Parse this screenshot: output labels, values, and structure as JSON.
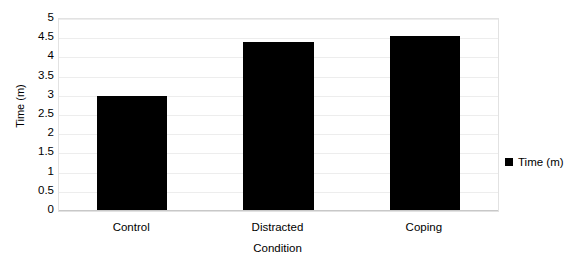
{
  "chart_data": {
    "type": "bar",
    "title": "",
    "categories": [
      "Control",
      "Distracted",
      "Coping"
    ],
    "values": [
      3.0,
      4.4,
      4.55
    ],
    "series": [
      {
        "name": "Time (m)",
        "values": [
          3.0,
          4.4,
          4.55
        ]
      }
    ],
    "xlabel": "Condition",
    "ylabel": "Time (m)",
    "ylim": [
      0,
      5
    ],
    "yticks": [
      "0",
      "0.5",
      "1",
      "1.5",
      "2",
      "2.5",
      "3",
      "3.5",
      "4",
      "4.5",
      "5"
    ],
    "ytick_values": [
      0,
      0.5,
      1,
      1.5,
      2,
      2.5,
      3,
      3.5,
      4,
      4.5,
      5
    ],
    "grid": true,
    "legend": {
      "position": "right",
      "entries": [
        {
          "label": "Time (m)",
          "color": "#000000",
          "marker": "square"
        }
      ]
    },
    "colors": {
      "bar": "#000000",
      "background": "#ffffff",
      "gridline": "#ededed",
      "plot_border": "#e2e2e2",
      "text": "#000000"
    }
  }
}
